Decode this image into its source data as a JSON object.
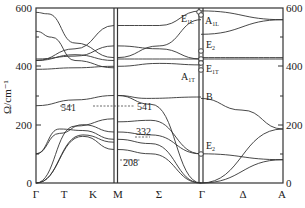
{
  "chart_data": {
    "type": "line",
    "title": "",
    "xlabel": "",
    "ylabel": "Ω/cm⁻¹",
    "ylabel_right": "/cm⁻¹",
    "ylim": [
      0,
      600
    ],
    "yticks": [
      0,
      200,
      400,
      600
    ],
    "grid": false,
    "x_points": [
      "Γ",
      "T",
      "K",
      "M",
      "Σ",
      "Γ",
      "Δ",
      "A"
    ],
    "panels": [
      {
        "name": "Γ-T-K-M",
        "labels": [
          "Γ",
          "T",
          "K",
          "M"
        ]
      },
      {
        "name": "M-Σ-Γ",
        "labels": [
          "M",
          "Σ",
          "Γ"
        ]
      },
      {
        "name": "Γ-Δ-A",
        "labels": [
          "Γ",
          "Δ",
          "A"
        ]
      }
    ],
    "annotations": [
      {
        "text": "541",
        "near": "T-K branch",
        "value": 541
      },
      {
        "text": "541",
        "near": "Σ branch",
        "value": 541
      },
      {
        "text": "332",
        "near": "Σ branch",
        "value": 332
      },
      {
        "text": "208",
        "near": "Σ branch",
        "value": 208
      }
    ],
    "gamma_modes": [
      {
        "label": "E1L",
        "value": 590
      },
      {
        "label": "A1L",
        "value": 580
      },
      {
        "label": "E2",
        "value": 450
      },
      {
        "label": "E1T",
        "value": 425
      },
      {
        "label": "A1T",
        "value": 405
      },
      {
        "label": "B",
        "value": 290
      },
      {
        "label": "E2",
        "value": 100
      }
    ],
    "series": [
      {
        "name": "panel1-b1",
        "x": [
          0,
          0.15,
          0.5,
          1.0
        ],
        "values": [
          585,
          580,
          480,
          430
        ]
      },
      {
        "name": "panel1-b2",
        "x": [
          0,
          0.2,
          0.5,
          1.0
        ],
        "values": [
          520,
          500,
          420,
          395
        ]
      },
      {
        "name": "panel1-b3",
        "x": [
          0,
          0.5,
          1.0
        ],
        "values": [
          420,
          460,
          540
        ]
      },
      {
        "name": "panel1-b4",
        "x": [
          0,
          0.5,
          1.0
        ],
        "values": [
          425,
          435,
          470
        ]
      },
      {
        "name": "panel1-b5",
        "x": [
          0,
          0.5,
          1.0
        ],
        "values": [
          420,
          440,
          420
        ]
      },
      {
        "name": "panel1-b6",
        "x": [
          0,
          0.5,
          1.0
        ],
        "values": [
          390,
          395,
          400
        ]
      },
      {
        "name": "panel1-b7",
        "x": [
          0,
          0.5,
          1.0
        ],
        "values": [
          265,
          285,
          300
        ]
      },
      {
        "name": "panel1-b8",
        "x": [
          0,
          0.5,
          1.0
        ],
        "values": [
          0,
          195,
          220
        ]
      },
      {
        "name": "panel1-b9",
        "x": [
          0,
          0.3,
          0.6,
          1.0
        ],
        "values": [
          100,
          170,
          200,
          175
        ]
      },
      {
        "name": "panel1-b10",
        "x": [
          0,
          0.3,
          0.6,
          1.0
        ],
        "values": [
          100,
          185,
          180,
          150
        ]
      },
      {
        "name": "panel1-b11",
        "x": [
          0,
          0.6,
          1.0
        ],
        "values": [
          0,
          165,
          140
        ]
      },
      {
        "name": "panel1-b12",
        "x": [
          0,
          0.6,
          1.0
        ],
        "values": [
          0,
          160,
          115
        ]
      },
      {
        "name": "panel2-b1",
        "x": [
          0,
          0.5,
          1.0
        ],
        "values": [
          540,
          540,
          590
        ]
      },
      {
        "name": "panel2-b2",
        "x": [
          0,
          0.5,
          1.0
        ],
        "values": [
          430,
          470,
          560
        ]
      },
      {
        "name": "panel2-b3",
        "x": [
          0,
          0.5,
          1.0
        ],
        "values": [
          470,
          460,
          425
        ]
      },
      {
        "name": "panel2-b4",
        "x": [
          0,
          0.5,
          1.0
        ],
        "values": [
          425,
          425,
          425
        ]
      },
      {
        "name": "panel2-b5",
        "x": [
          0,
          0.5,
          1.0
        ],
        "values": [
          400,
          410,
          405
        ]
      },
      {
        "name": "panel2-b6",
        "x": [
          0,
          0.35,
          1.0
        ],
        "values": [
          300,
          290,
          295
        ]
      },
      {
        "name": "panel2-b7",
        "x": [
          0,
          0.4,
          1.0
        ],
        "values": [
          300,
          270,
          0
        ]
      },
      {
        "name": "panel2-b8",
        "x": [
          0,
          0.4,
          1.0
        ],
        "values": [
          210,
          215,
          100
        ]
      },
      {
        "name": "panel2-b9",
        "x": [
          0,
          0.4,
          1.0
        ],
        "values": [
          175,
          165,
          100
        ]
      },
      {
        "name": "panel2-b10",
        "x": [
          0,
          0.4,
          1.0
        ],
        "values": [
          150,
          135,
          0
        ]
      },
      {
        "name": "panel2-b11",
        "x": [
          0,
          0.4,
          1.0
        ],
        "values": [
          115,
          100,
          0
        ]
      },
      {
        "name": "panel3-b1",
        "x": [
          0,
          1.0
        ],
        "values": [
          590,
          560
        ]
      },
      {
        "name": "panel3-b2",
        "x": [
          0,
          1.0
        ],
        "values": [
          510,
          560
        ]
      },
      {
        "name": "panel3-b3",
        "x": [
          0,
          1.0
        ],
        "values": [
          430,
          430
        ]
      },
      {
        "name": "panel3-b4",
        "x": [
          0,
          1.0
        ],
        "values": [
          425,
          425
        ]
      },
      {
        "name": "panel3-b5",
        "x": [
          0,
          0.5,
          1.0
        ],
        "values": [
          290,
          250,
          185
        ]
      },
      {
        "name": "panel3-b6",
        "x": [
          0,
          1.0
        ],
        "values": [
          100,
          80
        ]
      },
      {
        "name": "panel3-b7",
        "x": [
          0,
          1.0
        ],
        "values": [
          0,
          185
        ]
      },
      {
        "name": "panel3-b8",
        "x": [
          0,
          1.0
        ],
        "values": [
          0,
          80
        ]
      }
    ]
  },
  "labels": {
    "y_left": {
      "t600": "600",
      "t400": "400",
      "t200": "200",
      "t0": "0"
    },
    "y_right": {
      "t600": "600",
      "t400": "400",
      "t200": "200",
      "t0": "0"
    },
    "ylabel": "Ω/cm⁻¹",
    "x": {
      "g1": "Γ",
      "t": "T",
      "k": "K",
      "m": "M",
      "s": "Σ",
      "g2": "Γ",
      "d": "Δ",
      "a": "A"
    },
    "ann": {
      "a1": "541",
      "a2": "541",
      "a3": "332",
      "a4": "208"
    },
    "modes": {
      "e1l": "E",
      "e1l_sub": "1L",
      "a1l": "A",
      "a1l_sub": "1L",
      "e2a": "E",
      "e2a_sub": "2",
      "e1t": "E",
      "e1t_sub": "1T",
      "a1t": "A",
      "a1t_sub": "1T",
      "b": "B",
      "e2b": "E",
      "e2b_sub": "2"
    }
  }
}
